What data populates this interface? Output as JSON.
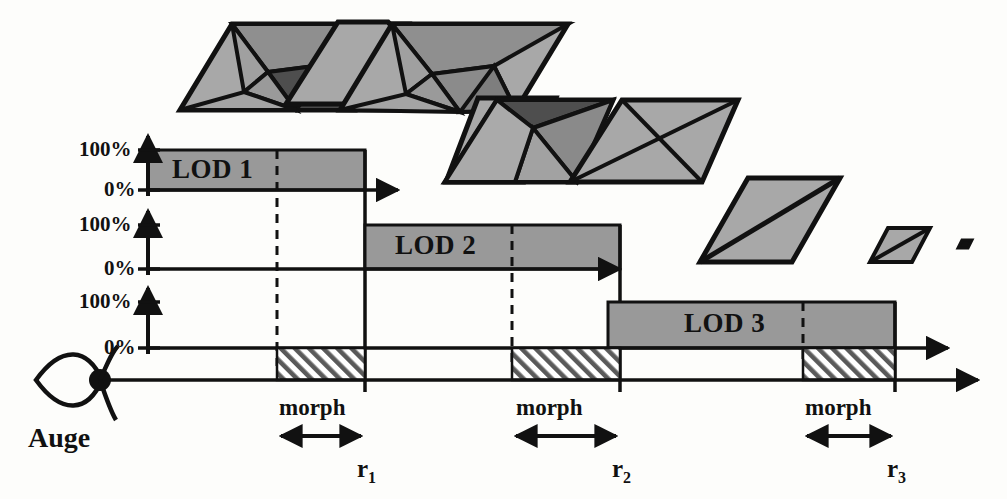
{
  "diagram": {
    "title_label": "Auge",
    "eye_icon": "eye-icon",
    "axis_labels": {
      "top": "100%",
      "bottom": "0%"
    },
    "rows": [
      {
        "id": "lod1",
        "label": "LOD 1",
        "axis_top": "100%",
        "axis_bottom": "0%",
        "bar_start_x": 148,
        "bar_end_x": 365,
        "morph_dash_x": 277,
        "bar_top_y": 150,
        "bar_bottom_y": 190,
        "axis_arrow_x": 405
      },
      {
        "id": "lod2",
        "label": "LOD 2",
        "axis_top": "100%",
        "axis_bottom": "0%",
        "bar_start_x": 365,
        "bar_end_x": 620,
        "morph_dash_x": 512,
        "bar_top_y": 225,
        "bar_bottom_y": 269,
        "axis_arrow_x": 620
      },
      {
        "id": "lod3",
        "label": "LOD 3",
        "axis_top": "100%",
        "axis_bottom": "0%",
        "bar_start_x": 608,
        "bar_end_x": 895,
        "morph_dash_x": 803,
        "bar_top_y": 302,
        "bar_bottom_y": 348,
        "axis_arrow_x": 955
      }
    ],
    "morph_regions": [
      {
        "label": "morph",
        "start_x": 277,
        "end_x": 365,
        "boundary_label": "r",
        "boundary_index": "1"
      },
      {
        "label": "morph",
        "start_x": 512,
        "end_x": 620,
        "boundary_label": "r",
        "boundary_index": "2"
      },
      {
        "label": "morph",
        "start_x": 803,
        "end_x": 895,
        "boundary_label": "r",
        "boundary_index": "3"
      }
    ],
    "distance_axis": {
      "y": 380,
      "start_x": 100,
      "end_x": 985
    },
    "meshes": [
      {
        "name": "mesh-lod1-a",
        "faces": "high",
        "size": "large"
      },
      {
        "name": "mesh-lod1-b",
        "faces": "high",
        "size": "large"
      },
      {
        "name": "mesh-lod2-a",
        "faces": "medium",
        "size": "medium"
      },
      {
        "name": "mesh-lod2-b",
        "faces": "medium",
        "size": "medium"
      },
      {
        "name": "mesh-lod3-a",
        "faces": "low",
        "size": "small"
      },
      {
        "name": "mesh-lod3-b",
        "faces": "low",
        "size": "tiny"
      },
      {
        "name": "mesh-lod3-c",
        "faces": "none",
        "size": "point"
      }
    ],
    "colors": {
      "bar_fill": "#999999",
      "mesh_light": "#a8a8a8",
      "mesh_mid": "#8f8f8f",
      "mesh_dark": "#555555",
      "stroke": "#111111",
      "background": "#fdfdfb"
    }
  }
}
